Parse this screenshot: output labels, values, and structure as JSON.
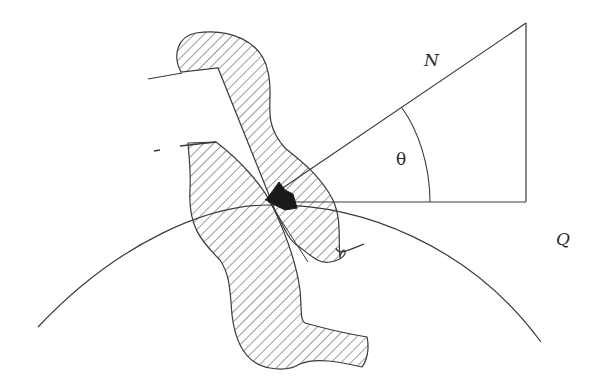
{
  "diagram": {
    "labels": {
      "hypotenuse": "N",
      "angle": "θ",
      "point": "Q"
    },
    "colors": {
      "stroke": "#3a3a3a",
      "hatch": "#4a4a4a",
      "arrow_fill": "#1a1a1a",
      "background": "#ffffff"
    }
  }
}
